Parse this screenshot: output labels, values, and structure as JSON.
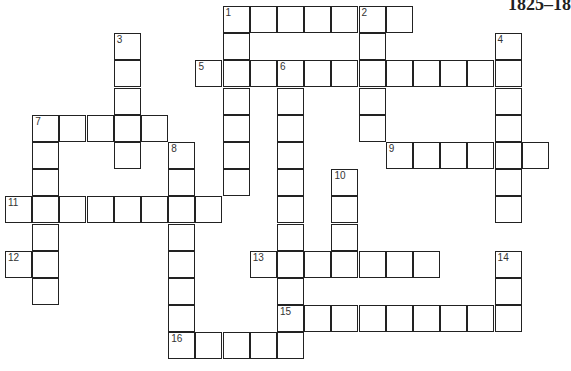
{
  "header": {
    "title": "1825–18"
  },
  "puzzle": {
    "entries": [
      {
        "number": 1,
        "direction": "across",
        "row": 0,
        "col": 8,
        "length": 7
      },
      {
        "number": 1,
        "direction": "down",
        "row": 0,
        "col": 8,
        "length": 7
      },
      {
        "number": 2,
        "direction": "down",
        "row": 0,
        "col": 13,
        "length": 5
      },
      {
        "number": 3,
        "direction": "down",
        "row": 1,
        "col": 4,
        "length": 5
      },
      {
        "number": 4,
        "direction": "down",
        "row": 1,
        "col": 18,
        "length": 7
      },
      {
        "number": 5,
        "direction": "across",
        "row": 2,
        "col": 7,
        "length": 12
      },
      {
        "number": 6,
        "direction": "down",
        "row": 2,
        "col": 10,
        "length": 11
      },
      {
        "number": 7,
        "direction": "across",
        "row": 4,
        "col": 1,
        "length": 5
      },
      {
        "number": 7,
        "direction": "down",
        "row": 4,
        "col": 1,
        "length": 7
      },
      {
        "number": 8,
        "direction": "down",
        "row": 5,
        "col": 6,
        "length": 8
      },
      {
        "number": 9,
        "direction": "across",
        "row": 5,
        "col": 14,
        "length": 6
      },
      {
        "number": 10,
        "direction": "down",
        "row": 6,
        "col": 12,
        "length": 4
      },
      {
        "number": 11,
        "direction": "across",
        "row": 7,
        "col": 0,
        "length": 8
      },
      {
        "number": 12,
        "direction": "across",
        "row": 9,
        "col": 0,
        "length": 2
      },
      {
        "number": 13,
        "direction": "across",
        "row": 9,
        "col": 9,
        "length": 7
      },
      {
        "number": 14,
        "direction": "down",
        "row": 9,
        "col": 18,
        "length": 3
      },
      {
        "number": 15,
        "direction": "across",
        "row": 11,
        "col": 10,
        "length": 9
      },
      {
        "number": 16,
        "direction": "across",
        "row": 12,
        "col": 6,
        "length": 5
      }
    ]
  }
}
